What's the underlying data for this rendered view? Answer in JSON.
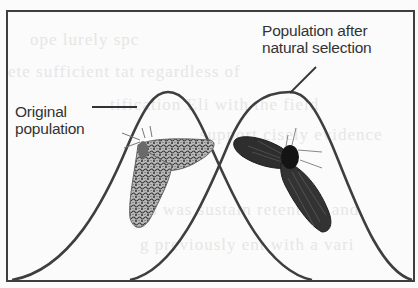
{
  "figure": {
    "panel_letter": "(b)",
    "labels": {
      "original_line1": "Original",
      "original_line2": "population",
      "after_line1": "Population after",
      "after_line2": "natural selection"
    },
    "curves": [
      {
        "name": "original-population-curve",
        "peak_x": 168,
        "peak_y": 92,
        "base_left_x": 12,
        "base_right_x": 312
      },
      {
        "name": "selected-population-curve",
        "peak_x": 290,
        "peak_y": 92,
        "base_left_x": 130,
        "base_right_x": 412
      }
    ],
    "moths": [
      {
        "name": "light-peppered-moth",
        "color": "#8a8a8a"
      },
      {
        "name": "dark-melanic-moth",
        "color": "#2a2a2a"
      }
    ],
    "colors": {
      "stroke": "#3e3e3e",
      "background": "#fbfbfb",
      "text": "#333333"
    },
    "bleed_through_text": [
      "ope     lurely        spc",
      "ete sufficient tat regardless of",
      "tification Eli     with the field",
      "support        cisely    evidence",
      "s was sustain     retention and",
      "g previously     ent with a vari"
    ]
  }
}
